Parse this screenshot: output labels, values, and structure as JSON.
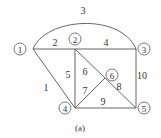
{
  "diagram": {
    "type": "graph",
    "caption": "(a)",
    "colors": {
      "line": "#444444",
      "text": "#333333",
      "background": "#ffffff"
    },
    "nodes": [
      {
        "id": "1",
        "label": "1"
      },
      {
        "id": "2",
        "label": "2"
      },
      {
        "id": "3",
        "label": "3"
      },
      {
        "id": "4",
        "label": "4"
      },
      {
        "id": "5",
        "label": "5"
      },
      {
        "id": "6",
        "label": "6"
      }
    ],
    "edges": [
      {
        "label": "1",
        "from": "1",
        "to": "4"
      },
      {
        "label": "2",
        "from": "1",
        "to": "2"
      },
      {
        "label": "3",
        "from": "1",
        "to": "3",
        "shape": "arc"
      },
      {
        "label": "4",
        "from": "2",
        "to": "3"
      },
      {
        "label": "5",
        "from": "2",
        "to": "4"
      },
      {
        "label": "6",
        "from": "2",
        "to": "6"
      },
      {
        "label": "7",
        "from": "4",
        "to": "6"
      },
      {
        "label": "8",
        "from": "6",
        "to": "5"
      },
      {
        "label": "9",
        "from": "4",
        "to": "5"
      },
      {
        "label": "10",
        "from": "3",
        "to": "5"
      }
    ]
  }
}
